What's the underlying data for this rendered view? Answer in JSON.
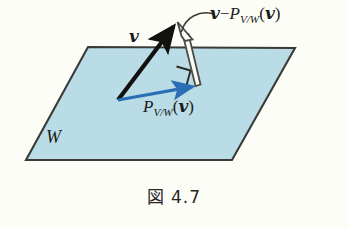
{
  "figure": {
    "caption_symbol": "図",
    "caption_number": "4.7",
    "background_color": "#fdfdf8"
  },
  "plane": {
    "name": "W",
    "label": "W",
    "fill_color": "#b9dce6",
    "edge_color": "#3a3a38",
    "corners": [
      [
        88,
        47
      ],
      [
        295,
        48
      ],
      [
        232,
        160
      ],
      [
        26,
        160
      ]
    ]
  },
  "vectors": [
    {
      "id": "v",
      "label_text": "v",
      "color": "#111110",
      "style": "solid-filled-arrow",
      "from": [
        118,
        100
      ],
      "to": [
        176,
        22
      ]
    },
    {
      "id": "projection",
      "label_prefix": "P",
      "label_subscript": "V/W",
      "label_arg": "(v)",
      "color": "#2a6fb5",
      "style": "solid-filled-arrow",
      "from": [
        118,
        100
      ],
      "to": [
        196,
        86
      ]
    },
    {
      "id": "difference",
      "label_minus": "−",
      "label_left": "v",
      "label_prefix": "P",
      "label_subscript": "V/W",
      "label_arg": "(v)",
      "color": "#4a4a46",
      "style": "outlined-arrow",
      "from": [
        196,
        86
      ],
      "to": [
        178,
        25
      ]
    }
  ],
  "right_angle_marker": {
    "name": "right-angle-marker",
    "position": [
      178,
      68
    ],
    "size": 15
  },
  "leader_line": {
    "name": "leader-curve",
    "from": [
      180,
      30
    ],
    "to": [
      212,
      14
    ]
  },
  "labels": {
    "v": "v",
    "W": "W",
    "P": "P",
    "sub_VW": "V/W",
    "open_paren": "(",
    "close_paren": ")",
    "minus": "−"
  }
}
